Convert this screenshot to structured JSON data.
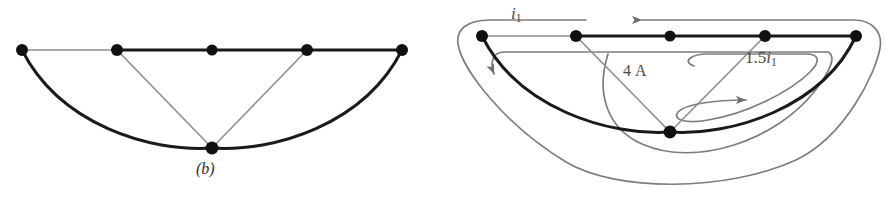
{
  "figure": {
    "background_color": "#ffffff",
    "panels": [
      {
        "id": "b",
        "caption": "(b)",
        "node_count": 6,
        "node_color": "#111111",
        "edge_color_thick": "#1a1a1a",
        "edge_color_thin": "#8d8d8d",
        "nodes": [
          {
            "name": "node-b-1",
            "x": 22,
            "y": 50
          },
          {
            "name": "node-b-2",
            "x": 117,
            "y": 50
          },
          {
            "name": "node-b-3",
            "x": 212,
            "y": 50
          },
          {
            "name": "node-b-4",
            "x": 307,
            "y": 50
          },
          {
            "name": "node-b-5",
            "x": 402,
            "y": 50
          },
          {
            "name": "node-b-6",
            "x": 212,
            "y": 148
          }
        ]
      },
      {
        "id": "c",
        "caption": "(c)",
        "node_count": 6,
        "node_color": "#111111",
        "edge_color_thick": "#1a1a1a",
        "edge_color_thin": "#8d8d8d",
        "loop_color": "#7d7d7d",
        "nodes": [
          {
            "name": "node-c-1",
            "x": 36,
            "y": 36
          },
          {
            "name": "node-c-2",
            "x": 130,
            "y": 36
          },
          {
            "name": "node-c-3",
            "x": 224,
            "y": 36
          },
          {
            "name": "node-c-4",
            "x": 319,
            "y": 36
          },
          {
            "name": "node-c-5",
            "x": 410,
            "y": 36
          },
          {
            "name": "node-c-6",
            "x": 224,
            "y": 132
          }
        ],
        "labels": [
          {
            "name": "mesh-current-i1",
            "prefix": "",
            "symbol": "i",
            "sub": "1",
            "text": "i1"
          },
          {
            "name": "current-source-4a",
            "prefix": "4 A",
            "symbol": "",
            "sub": "",
            "text": "4 A"
          },
          {
            "name": "dependent-source-15i1",
            "prefix": "1.5",
            "symbol": "i",
            "sub": "1",
            "text": "1.5i1"
          }
        ],
        "loops": [
          {
            "name": "outer-mesh-loop",
            "label": "i1",
            "arrow_direction": "left"
          },
          {
            "name": "middle-mesh-loop",
            "label": "4 A",
            "arrow_direction": "down"
          },
          {
            "name": "inner-mesh-loop",
            "label": "1.5i1",
            "arrow_direction": "up-right"
          }
        ]
      }
    ]
  }
}
